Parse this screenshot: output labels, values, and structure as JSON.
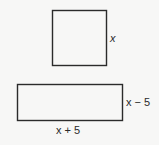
{
  "figure": {
    "square": {
      "side_label": "x"
    },
    "rectangle": {
      "height_label": "x − 5",
      "width_label": "x + 5"
    }
  }
}
